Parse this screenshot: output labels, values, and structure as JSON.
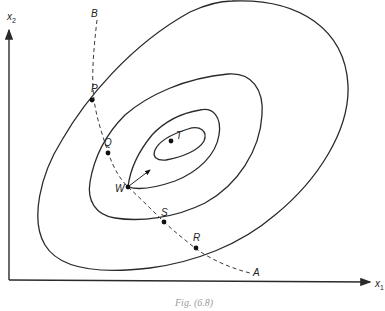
{
  "figure": {
    "caption": "Fig. (6.8)",
    "axes": {
      "x_label": "x",
      "x_sub": "1",
      "y_label": "x",
      "y_sub": "2"
    },
    "path": {
      "start_label": "B",
      "end_label": "A",
      "style": "dashed"
    },
    "points": [
      {
        "id": "P",
        "label": "P"
      },
      {
        "id": "Q",
        "label": "Q"
      },
      {
        "id": "W",
        "label": "W"
      },
      {
        "id": "S",
        "label": "S"
      },
      {
        "id": "R",
        "label": "R"
      },
      {
        "id": "T",
        "label": "T"
      }
    ],
    "contours": [
      {
        "name": "outer-contour",
        "level": 1
      },
      {
        "name": "second-contour",
        "level": 2
      },
      {
        "name": "third-contour",
        "level": 3
      },
      {
        "name": "inner-contour",
        "level": 4
      }
    ],
    "gradient_arrow": {
      "from": "W",
      "direction": "toward T"
    },
    "colors": {
      "line": "#2a2a2a",
      "background": "#ffffff"
    }
  }
}
